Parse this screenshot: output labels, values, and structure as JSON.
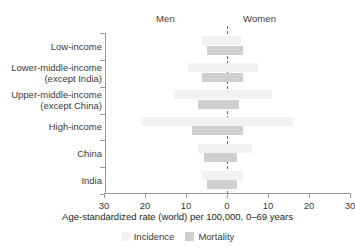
{
  "header": {
    "men_label": "Men",
    "women_label": "Women"
  },
  "colors": {
    "incidence": "#f2f2f2",
    "mortality": "#cfcfcf",
    "axis": "#9a9a9a",
    "text": "#3b3b3b",
    "zero_line": "#6e6e6e"
  },
  "legend": {
    "position": "bottom-center",
    "items": [
      {
        "label": "Incidence",
        "color": "#f2f2f2"
      },
      {
        "label": "Mortality",
        "color": "#cfcfcf"
      }
    ]
  },
  "chart_data": {
    "type": "bar",
    "orientation": "horizontal-diverging",
    "title": "",
    "xlabel": "Age-standardized rate (world) per 100,000, 0–69 years",
    "ylabel": "",
    "xlim": [
      -30,
      30
    ],
    "xticks": [
      -30,
      -20,
      -10,
      0,
      10,
      20,
      30
    ],
    "xticklabels": [
      "30",
      "20",
      "10",
      "0",
      "10",
      "20",
      "30"
    ],
    "grid": false,
    "left_panel": "Men",
    "right_panel": "Women",
    "zero_line": true,
    "categories": [
      "Low-income",
      "Lower-middle-income\n(except India)",
      "Upper-middle-income\n(except China)",
      "High-income",
      "China",
      "India"
    ],
    "series": [
      {
        "name": "Incidence",
        "color": "#f2f2f2",
        "men": [
          6.0,
          9.5,
          13.0,
          21.0,
          7.0,
          6.0
        ],
        "women": [
          3.5,
          7.5,
          11.0,
          16.0,
          6.0,
          4.0
        ]
      },
      {
        "name": "Mortality",
        "color": "#cfcfcf",
        "men": [
          5.0,
          6.0,
          7.0,
          8.5,
          5.5,
          5.0
        ],
        "women": [
          4.0,
          4.0,
          3.0,
          4.0,
          2.5,
          2.5
        ]
      }
    ]
  }
}
